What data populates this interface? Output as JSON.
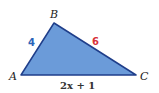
{
  "figure": {
    "type": "triangle",
    "fill_color": "#6b9bd9",
    "stroke_color": "#1f3e8a",
    "vertices": {
      "A": {
        "label": "A"
      },
      "B": {
        "label": "B"
      },
      "C": {
        "label": "C"
      }
    },
    "sides": {
      "AB": {
        "label": "4",
        "color": "#2a63b8"
      },
      "BC": {
        "label": "6",
        "color": "#d8333a"
      },
      "AC": {
        "label": "2x + 1",
        "color": "#333333"
      }
    }
  }
}
